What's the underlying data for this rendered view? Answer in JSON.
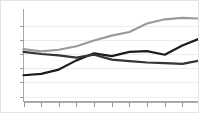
{
  "chart_data": {
    "type": "line",
    "title": "",
    "subtitle": "",
    "xlabel": "",
    "ylabel": "",
    "grid": true,
    "legend": "none",
    "xlim": [
      0,
      10
    ],
    "ylim": [
      0,
      6
    ],
    "x": [
      0,
      1,
      2,
      3,
      4,
      5,
      6,
      7,
      8,
      9,
      10
    ],
    "xticklabels": [
      "",
      "",
      "",
      "",
      "",
      "",
      "",
      "",
      "",
      "",
      ""
    ],
    "yticklabels": [
      "",
      "",
      "",
      "",
      "",
      ""
    ],
    "yticks": [
      0,
      1,
      2,
      3,
      4,
      5
    ],
    "series": [
      {
        "name": "series-1",
        "color": "#9a9a9a",
        "width": 2.2,
        "values": [
          3.35,
          3.18,
          3.3,
          3.55,
          3.95,
          4.3,
          4.55,
          5.15,
          5.45,
          5.55,
          5.5
        ]
      },
      {
        "name": "series-2",
        "color": "#1c1c1c",
        "width": 2.2,
        "values": [
          1.5,
          1.6,
          1.9,
          2.55,
          3.05,
          2.85,
          3.15,
          3.2,
          2.95,
          3.6,
          4.1
        ]
      },
      {
        "name": "series-3",
        "color": "#343434",
        "width": 2.2,
        "values": [
          3.15,
          3.0,
          2.9,
          2.75,
          2.95,
          2.6,
          2.5,
          2.4,
          2.35,
          2.3,
          2.55
        ]
      }
    ]
  },
  "axes": {
    "y_axis_name": "y-axis",
    "x_axis_name": "x-axis",
    "tick_count_x": 11,
    "tick_count_y": 6
  }
}
